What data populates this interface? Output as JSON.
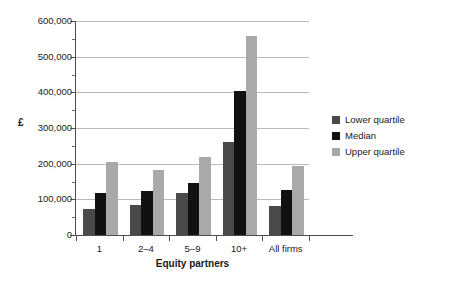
{
  "chart_data": {
    "type": "bar",
    "title": "",
    "subtitle": "",
    "xlabel": "Equity partners",
    "ylabel": "£",
    "categories": [
      "1",
      "2–4",
      "5–9",
      "10+",
      "All firms"
    ],
    "series": [
      {
        "name": "Lower quartile",
        "color": "#4a4a4a",
        "values": [
          73000,
          85000,
          117000,
          262000,
          82000
        ]
      },
      {
        "name": "Median",
        "color": "#111111",
        "values": [
          118000,
          123000,
          146000,
          403000,
          125000
        ]
      },
      {
        "name": "Upper quartile",
        "color": "#a9a9a9",
        "values": [
          206000,
          182000,
          220000,
          557000,
          194000
        ]
      }
    ],
    "ylim": [
      0,
      600000
    ],
    "ytick_values": [
      0,
      100000,
      200000,
      300000,
      400000,
      500000,
      600000
    ],
    "ytick_labels": [
      "0",
      "100,000",
      "200,000",
      "300,000",
      "400,000",
      "500,000",
      "600,000"
    ],
    "grid": true,
    "grid_axis": "y",
    "legend_position": "right",
    "background": "#ffffff",
    "axis_color": "#4d4d4d",
    "gridline_color": "#b9b9b9"
  }
}
